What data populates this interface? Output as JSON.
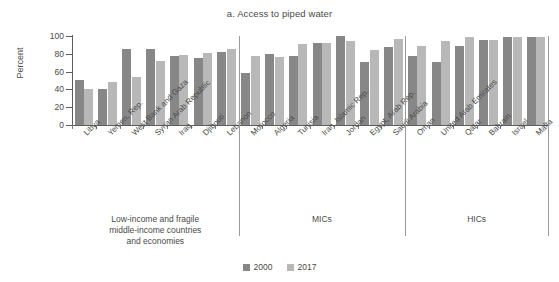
{
  "chart_data": {
    "type": "bar",
    "title": "a. Access to piped water",
    "xlabel": "",
    "ylabel": "Percent",
    "ylim": [
      0,
      100
    ],
    "yticks": [
      0,
      20,
      40,
      60,
      80,
      100
    ],
    "grid": false,
    "legend_position": "bottom",
    "categories": [
      "Libya",
      "Yemen, Rep.",
      "West Bank and Gaza",
      "Syrian Arab Republic",
      "Iraq",
      "Djibouti",
      "Lebanon",
      "Morocco",
      "Algeria",
      "Tunisia",
      "Iran, Islamic Rep.",
      "Jordan",
      "Egypt, Arab Rep.",
      "Saudi Arabia",
      "Oman",
      "United Arab Emirates",
      "Qatar",
      "Bahrain",
      "Israel",
      "Malta"
    ],
    "series": [
      {
        "name": "2000",
        "color": "#878787",
        "values": [
          51,
          40,
          85,
          85,
          77,
          75,
          82,
          58,
          80,
          78,
          92,
          100,
          71,
          88,
          77,
          71,
          89,
          96,
          99,
          99
        ]
      },
      {
        "name": "2017",
        "color": "#b8b8b8",
        "values": [
          40,
          48,
          54,
          72,
          79,
          81,
          85,
          77,
          76,
          91,
          92,
          94,
          84,
          97,
          89,
          94,
          99,
          96,
          99,
          99
        ]
      }
    ],
    "groups": [
      {
        "label": "Low-income and fragile\nmiddle-income countries\nand economies",
        "start": 0,
        "end": 6
      },
      {
        "label": "MICs",
        "start": 7,
        "end": 13
      },
      {
        "label": "HICs",
        "start": 14,
        "end": 19
      }
    ]
  },
  "group_labels": {
    "low_income": [
      "Low-income and fragile",
      "middle-income countries",
      "and economies"
    ],
    "mics": "MICs",
    "hics": "HICs"
  },
  "legend": {
    "items": [
      {
        "label": "2000",
        "color": "#878787"
      },
      {
        "label": "2017",
        "color": "#b8b8b8"
      }
    ]
  }
}
